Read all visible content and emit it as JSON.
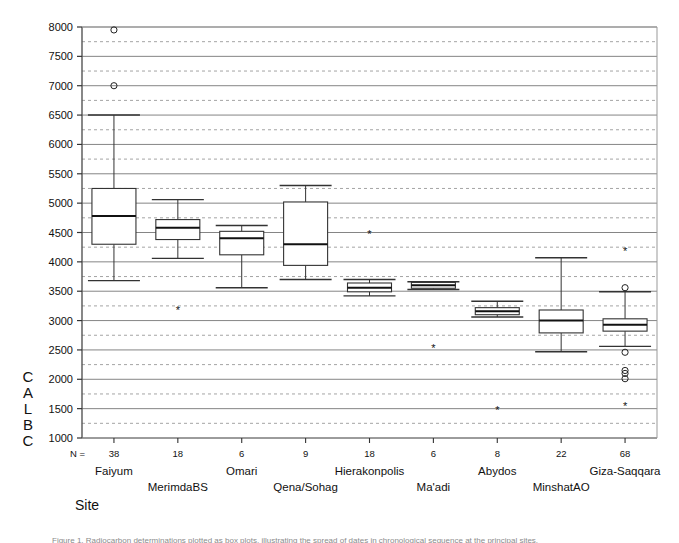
{
  "figure": {
    "y_axis_title_chars": [
      "C",
      "A",
      "L",
      "B",
      "C"
    ],
    "x_axis_title": "Site",
    "n_prefix": "N =",
    "caption_fragment": "Figure 1. Radiocarbon determinations plotted as box plots, illustrating the spread of dates in chronological sequence at the principal sites."
  },
  "chart_data": {
    "type": "boxplot",
    "title": "",
    "xlabel": "Site",
    "ylabel": "CALBC",
    "ylim": [
      1000,
      8000
    ],
    "ytick_step": 500,
    "yticks": [
      1000,
      1500,
      2000,
      2500,
      3000,
      3500,
      4000,
      4500,
      5000,
      5500,
      6000,
      6500,
      7000,
      7500,
      8000
    ],
    "ytick_labels": [
      "1000",
      "1500",
      "2000",
      "2500",
      "3000",
      "3500",
      "4000",
      "4500",
      "5000",
      "5500",
      "6000",
      "6500",
      "7000",
      "7500",
      "8000"
    ],
    "grid": "horizontal-solid-major-dotted-minor",
    "minor_grid_step": 250,
    "legend": "none",
    "categories": [
      "Faiyum",
      "MerimdaBS",
      "Omari",
      "Qena/Sohag",
      "Hierakonpolis",
      "Ma'adi",
      "Abydos",
      "MinshatAO",
      "Giza-Saqqara"
    ],
    "n_values": [
      38,
      18,
      6,
      9,
      18,
      6,
      8,
      22,
      68
    ],
    "boxes": [
      {
        "category": "Faiyum",
        "n": 38,
        "whisker_low": 3680,
        "q1": 4300,
        "median": 4780,
        "q3": 5250,
        "whisker_high": 6500,
        "outliers": [
          7000,
          7950
        ],
        "extremes": []
      },
      {
        "category": "MerimdaBS",
        "n": 18,
        "whisker_low": 4060,
        "q1": 4380,
        "median": 4580,
        "q3": 4720,
        "whisker_high": 5060,
        "outliers": [],
        "extremes": [
          3180
        ]
      },
      {
        "category": "Omari",
        "n": 6,
        "whisker_low": 3560,
        "q1": 4120,
        "median": 4400,
        "q3": 4520,
        "whisker_high": 4620,
        "outliers": [],
        "extremes": []
      },
      {
        "category": "Qena/Sohag",
        "n": 9,
        "whisker_low": 3700,
        "q1": 3940,
        "median": 4300,
        "q3": 5020,
        "whisker_high": 5300,
        "outliers": [],
        "extremes": []
      },
      {
        "category": "Hierakonpolis",
        "n": 18,
        "whisker_low": 3420,
        "q1": 3490,
        "median": 3560,
        "q3": 3640,
        "whisker_high": 3700,
        "outliers": [],
        "extremes": [
          4470
        ]
      },
      {
        "category": "Ma'adi",
        "n": 6,
        "whisker_low": 3530,
        "q1": 3550,
        "median": 3600,
        "q3": 3650,
        "whisker_high": 3660,
        "outliers": [],
        "extremes": [
          2530
        ]
      },
      {
        "category": "Abydos",
        "n": 8,
        "whisker_low": 3060,
        "q1": 3100,
        "median": 3160,
        "q3": 3220,
        "whisker_high": 3330,
        "outliers": [],
        "extremes": [
          1470
        ]
      },
      {
        "category": "MinshatAO",
        "n": 22,
        "whisker_low": 2470,
        "q1": 2790,
        "median": 3000,
        "q3": 3180,
        "whisker_high": 4070,
        "outliers": [],
        "extremes": []
      },
      {
        "category": "Giza-Saqqara",
        "n": 68,
        "whisker_low": 2560,
        "q1": 2820,
        "median": 2930,
        "q3": 3030,
        "whisker_high": 3490,
        "outliers": [
          2460,
          2150,
          2100,
          2010
        ],
        "extremes": [
          4170,
          1530
        ]
      }
    ],
    "giza_extra_outlier_at_3560": 3560
  }
}
